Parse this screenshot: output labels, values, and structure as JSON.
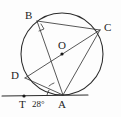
{
  "figure": {
    "type": "circle-geometry-diagram",
    "width": 121,
    "height": 117,
    "background_color": "#fdfdfd",
    "stroke_color": "#2b2b2b"
  },
  "circle": {
    "center_label": "O",
    "center_x": 62,
    "center_y": 54,
    "radius": 41
  },
  "points": [
    {
      "id": "B",
      "label": "B",
      "x": 37,
      "y": 21,
      "label_x": 25,
      "label_y": 10,
      "on_circle": true,
      "dot": false
    },
    {
      "id": "C",
      "label": "C",
      "x": 100,
      "y": 30,
      "label_x": 104,
      "label_y": 22,
      "on_circle": true,
      "dot": false
    },
    {
      "id": "O",
      "label": "O",
      "x": 62,
      "y": 54,
      "label_x": 58,
      "label_y": 40,
      "on_circle": false,
      "dot": true
    },
    {
      "id": "D",
      "label": "D",
      "x": 25,
      "y": 78,
      "label_x": 11,
      "label_y": 70,
      "on_circle": true,
      "dot": false
    },
    {
      "id": "A",
      "label": "A",
      "x": 63,
      "y": 95,
      "label_x": 58,
      "label_y": 99,
      "on_circle": true,
      "dot": false
    },
    {
      "id": "T",
      "label": "T",
      "x": 24,
      "y": 96,
      "label_x": 19,
      "label_y": 99,
      "on_circle": false,
      "dot": true
    }
  ],
  "segments": [
    {
      "id": "BC",
      "from": "B",
      "to": "C",
      "kind": "chord"
    },
    {
      "id": "BA",
      "from": "B",
      "to": "A",
      "kind": "chord"
    },
    {
      "id": "DA",
      "from": "D",
      "to": "A",
      "kind": "chord"
    },
    {
      "id": "DC",
      "from": "D",
      "to": "C",
      "kind": "diameter"
    },
    {
      "id": "CA",
      "from": "C",
      "to": "A",
      "kind": "chord"
    }
  ],
  "tangent_line": {
    "id": "tangent-at-A",
    "x1": 2,
    "y1": 96,
    "x2": 88,
    "y2": 95,
    "touch_point": "A"
  },
  "angles": [
    {
      "id": "angle-TAD",
      "label": "28°",
      "value": 28,
      "unit": "degrees",
      "vertex": "A",
      "label_x": 32,
      "label_y": 100,
      "mark": "arc"
    },
    {
      "id": "angle-at-B",
      "label": "",
      "vertex": "B",
      "mark": "right-angle"
    },
    {
      "id": "angle-at-A-inner",
      "label": "",
      "vertex": "A",
      "mark": "arc"
    }
  ],
  "labels": {
    "B": "B",
    "C": "C",
    "O": "O",
    "D": "D",
    "A": "A",
    "T": "T",
    "angle_TAD": "28°"
  }
}
